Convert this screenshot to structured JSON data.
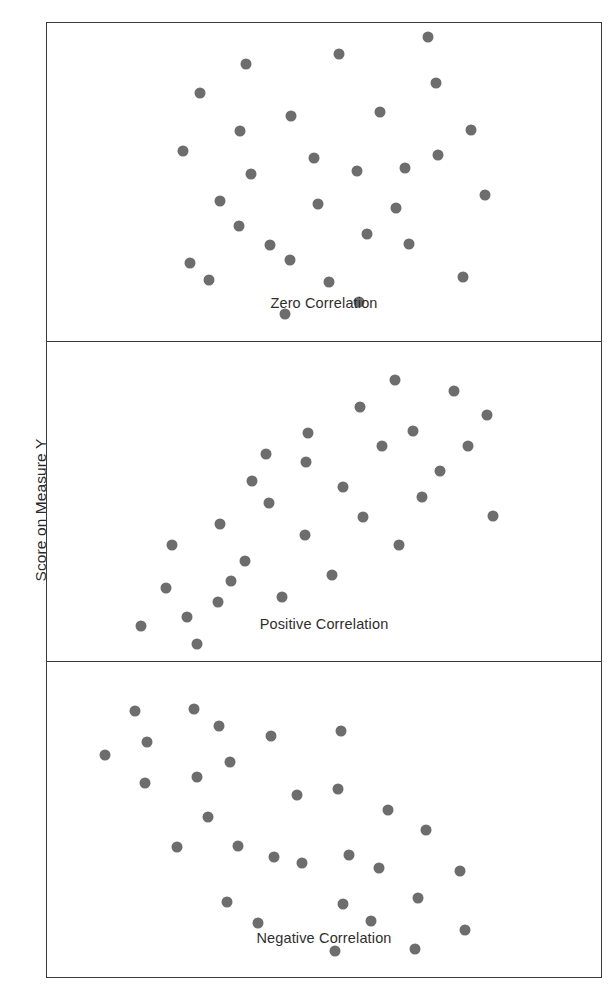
{
  "figure": {
    "background_color": "#ffffff",
    "frame_color": "#3a3a3a",
    "dot_color": "#6d6d6d",
    "axis_label_y": "Score on Measure Y"
  },
  "panels": [
    {
      "label": "Zero Correlation"
    },
    {
      "label": "Positive Correlation"
    },
    {
      "label": "Negative Correlation"
    }
  ],
  "chart_data": [
    {
      "type": "scatter",
      "title": "Zero Correlation",
      "xlabel": "",
      "ylabel": "Score on Measure Y",
      "xlim": [
        0,
        100
      ],
      "ylim": [
        0,
        100
      ],
      "grid": false,
      "legend": false,
      "marker": {
        "shape": "circle",
        "color": "#6d6d6d",
        "size_px": 11
      },
      "n_points": 28,
      "points": [
        [
          24.5,
          59.8
        ],
        [
          25.8,
          24.6
        ],
        [
          27.6,
          78.0
        ],
        [
          31.3,
          43.9
        ],
        [
          29.3,
          19.1
        ],
        [
          34.6,
          36.2
        ],
        [
          35.9,
          87.2
        ],
        [
          34.8,
          66.0
        ],
        [
          36.9,
          52.6
        ],
        [
          40.2,
          30.1
        ],
        [
          44.0,
          70.7
        ],
        [
          43.8,
          25.4
        ],
        [
          43.0,
          8.5
        ],
        [
          48.2,
          57.5
        ],
        [
          49.0,
          43.0
        ],
        [
          50.9,
          18.4
        ],
        [
          52.7,
          90.3
        ],
        [
          55.9,
          53.5
        ],
        [
          57.7,
          33.5
        ],
        [
          56.3,
          12.4
        ],
        [
          60.1,
          72.0
        ],
        [
          63.0,
          41.7
        ],
        [
          64.6,
          54.5
        ],
        [
          65.4,
          30.5
        ],
        [
          68.7,
          95.5
        ],
        [
          70.6,
          58.4
        ],
        [
          70.2,
          81.0
        ],
        [
          76.6,
          66.5
        ],
        [
          75.0,
          20.2
        ],
        [
          79.0,
          46.0
        ]
      ]
    },
    {
      "type": "scatter",
      "title": "Positive Correlation",
      "xlabel": "",
      "ylabel": "Score on Measure Y",
      "xlim": [
        0,
        100
      ],
      "ylim": [
        0,
        100
      ],
      "grid": false,
      "legend": false,
      "marker": {
        "shape": "circle",
        "color": "#6d6d6d",
        "size_px": 11
      },
      "n_points": 28,
      "points": [
        [
          17.0,
          11.0
        ],
        [
          21.5,
          23.0
        ],
        [
          25.3,
          13.8
        ],
        [
          22.5,
          36.5
        ],
        [
          27.0,
          5.2
        ],
        [
          31.3,
          43.0
        ],
        [
          33.2,
          25.0
        ],
        [
          30.8,
          18.5
        ],
        [
          37.0,
          56.5
        ],
        [
          35.8,
          31.5
        ],
        [
          40.0,
          49.5
        ],
        [
          39.6,
          65.0
        ],
        [
          42.5,
          20.0
        ],
        [
          46.5,
          39.5
        ],
        [
          46.8,
          62.5
        ],
        [
          47.2,
          71.5
        ],
        [
          51.5,
          27.0
        ],
        [
          53.5,
          54.5
        ],
        [
          56.5,
          79.5
        ],
        [
          57.0,
          45.0
        ],
        [
          60.5,
          67.5
        ],
        [
          62.8,
          88.0
        ],
        [
          63.5,
          36.5
        ],
        [
          66.0,
          72.0
        ],
        [
          67.6,
          51.5
        ],
        [
          71.0,
          59.5
        ],
        [
          73.5,
          84.5
        ],
        [
          76.0,
          67.5
        ],
        [
          79.5,
          77.0
        ],
        [
          80.5,
          45.5
        ]
      ]
    },
    {
      "type": "scatter",
      "title": "Negative Correlation",
      "xlabel": "",
      "ylabel": "Score on Measure Y",
      "xlim": [
        0,
        100
      ],
      "ylim": [
        0,
        100
      ],
      "grid": false,
      "legend": false,
      "marker": {
        "shape": "circle",
        "color": "#6d6d6d",
        "size_px": 11
      },
      "n_points": 28,
      "points": [
        [
          10.5,
          70.5
        ],
        [
          15.8,
          84.5
        ],
        [
          18.0,
          74.5
        ],
        [
          17.6,
          61.5
        ],
        [
          26.5,
          85.0
        ],
        [
          27.0,
          63.5
        ],
        [
          23.5,
          41.0
        ],
        [
          31.0,
          79.5
        ],
        [
          29.0,
          50.5
        ],
        [
          33.0,
          68.0
        ],
        [
          34.5,
          41.5
        ],
        [
          32.5,
          23.5
        ],
        [
          40.5,
          76.5
        ],
        [
          41.0,
          38.0
        ],
        [
          38.0,
          17.0
        ],
        [
          46.0,
          36.0
        ],
        [
          45.2,
          57.5
        ],
        [
          53.0,
          78.0
        ],
        [
          52.5,
          59.5
        ],
        [
          54.5,
          38.5
        ],
        [
          53.5,
          23.0
        ],
        [
          52.0,
          8.0
        ],
        [
          61.5,
          53.0
        ],
        [
          60.0,
          34.5
        ],
        [
          58.5,
          17.5
        ],
        [
          68.5,
          46.5
        ],
        [
          67.0,
          25.0
        ],
        [
          66.5,
          8.5
        ],
        [
          74.5,
          33.5
        ],
        [
          75.5,
          14.5
        ]
      ]
    }
  ]
}
